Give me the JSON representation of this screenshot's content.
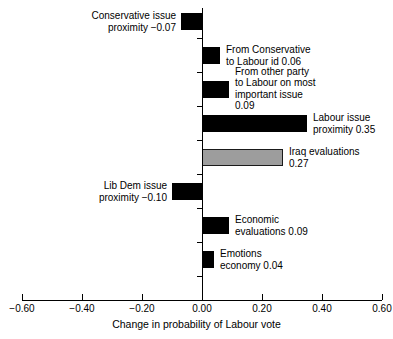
{
  "chart_data": {
    "type": "bar",
    "orientation": "horizontal",
    "title": "",
    "subtitle": "",
    "xlabel": "Change in probability of Labour vote",
    "ylabel": "",
    "xlim": [
      -0.6,
      0.6
    ],
    "grid": false,
    "legend": "none",
    "zero_line": true,
    "xticks": [
      -0.6,
      -0.4,
      -0.2,
      0.0,
      0.2,
      0.4,
      0.6
    ],
    "xtick_labels": [
      "−0.60",
      "−0.40",
      "−0.20",
      "0.00",
      "0.20",
      "0.40",
      "0.60"
    ],
    "categories": [
      "Conservative issue proximity",
      "From Conservative to Labour id",
      "From other party to Labour on most important issue",
      "Labour issue proximity",
      "Iraq evaluations",
      "Lib Dem issue proximity",
      "Economic evaluations",
      "Emotions economy"
    ],
    "values": [
      -0.07,
      0.06,
      0.09,
      0.35,
      0.27,
      -0.1,
      0.09,
      0.04
    ],
    "bars": [
      {
        "label": "Conservative issue\nproximity −0.07",
        "value": -0.07,
        "color": "#000000",
        "style": "solid",
        "label_side": "left"
      },
      {
        "label": "From Conservative\nto Labour id 0.06",
        "value": 0.06,
        "color": "#000000",
        "style": "solid",
        "label_side": "right"
      },
      {
        "label": "From other party\nto Labour on most\nimportant issue\n0.09",
        "value": 0.09,
        "color": "#000000",
        "style": "solid",
        "label_side": "right"
      },
      {
        "label": "Labour issue\nproximity 0.35",
        "value": 0.35,
        "color": "#000000",
        "style": "solid",
        "label_side": "right"
      },
      {
        "label": "Iraq evaluations\n0.27",
        "value": 0.27,
        "color": "#9d9d9d",
        "style": "gray",
        "label_side": "right"
      },
      {
        "label": "Lib Dem issue\nproximity −0.10",
        "value": -0.1,
        "color": "#000000",
        "style": "solid",
        "label_side": "left"
      },
      {
        "label": "Economic\nevaluations 0.09",
        "value": 0.09,
        "color": "#000000",
        "style": "solid",
        "label_side": "right"
      },
      {
        "label": "Emotions\neconomy 0.04",
        "value": 0.04,
        "color": "#000000",
        "style": "solid",
        "label_side": "right"
      }
    ],
    "colors": {
      "bar_solid": "#000000",
      "bar_highlight": "#9d9d9d",
      "bar_highlight_border": "#1a1a1a",
      "axis": "#000000",
      "text": "#000000",
      "background": "#ffffff"
    }
  }
}
